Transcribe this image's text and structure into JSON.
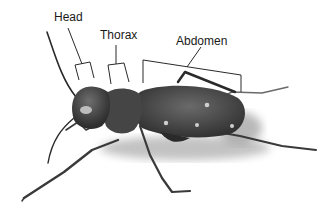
{
  "diagram": {
    "background_color": "#ffffff",
    "labels": [
      {
        "id": "head",
        "text": "Head",
        "x": 54,
        "y": 11
      },
      {
        "id": "thorax",
        "text": "Thorax",
        "x": 100,
        "y": 30
      },
      {
        "id": "abdomen",
        "text": "Abdomen",
        "x": 176,
        "y": 35
      }
    ],
    "colors": {
      "line": "#2a2a2a",
      "body_dark": "#3c3c3c",
      "body_mid": "#5a5a5a",
      "spot": "#cfcfcf",
      "shadow": "#b8b8b8"
    }
  }
}
